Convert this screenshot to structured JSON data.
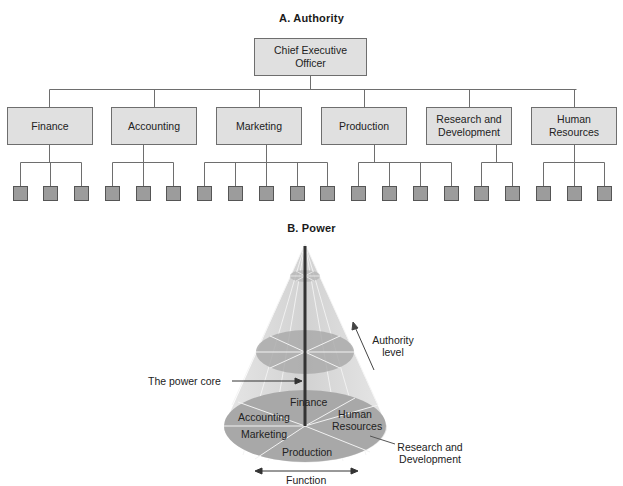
{
  "panel_a": {
    "title": "A.  Authority",
    "ceo": {
      "line1": "Chief Executive",
      "line2": "Officer"
    },
    "departments": [
      {
        "line1": "Finance",
        "line2": "",
        "subunits": 3
      },
      {
        "line1": "Accounting",
        "line2": "",
        "subunits": 3
      },
      {
        "line1": "Marketing",
        "line2": "",
        "subunits": 5
      },
      {
        "line1": "Production",
        "line2": "",
        "subunits": 4
      },
      {
        "line1": "Research and",
        "line2": "Development",
        "subunits": 2
      },
      {
        "line1": "Human",
        "line2": "Resources",
        "subunits": 3
      }
    ]
  },
  "panel_b": {
    "title": "B.  Power",
    "annotations": {
      "power_core": "The power core",
      "authority_line1": "Authority",
      "authority_line2": "level",
      "rd_line1": "Research and",
      "rd_line2": "Development",
      "function": "Function"
    },
    "base_segments": {
      "finance": "Finance",
      "accounting": "Accounting",
      "marketing": "Marketing",
      "production": "Production",
      "hr_line1": "Human",
      "hr_line2": "Resources"
    }
  },
  "colors": {
    "box_fill": "#e0e0e0",
    "leaf_fill": "#9c9c9c",
    "cone_fill": "#d9d9d9",
    "ellipse_fill": "#a8a8a8",
    "core": "#333333"
  }
}
